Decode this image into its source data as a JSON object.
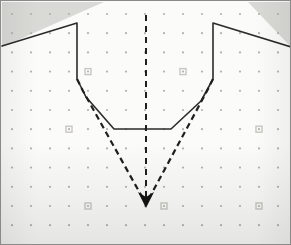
{
  "figure": {
    "title": "Cross-section profile over dot grid",
    "background_color": "#fbfbfa",
    "frame_color": "#8a8a88",
    "shaded_region_color": "#d9d9d6"
  },
  "geometry": {
    "frame": {
      "x": 0,
      "y": 0,
      "width": 291,
      "height": 245
    },
    "plot_area": {
      "x": 1,
      "y": 1,
      "width": 289,
      "height": 243
    },
    "centerline_x": 145,
    "apex": {
      "x": 145,
      "y": 203
    },
    "left_wall_x": 76,
    "right_wall_x": 212,
    "wall_top_y": 22,
    "wall_bottom_y": 78,
    "flat_bottom_y": 128,
    "flat_bottom_x_start": 113,
    "flat_bottom_x_end": 170
  },
  "grid": {
    "label": "reference dot grid",
    "dot_color": "#b6b3ad",
    "dot_radius": 1.1,
    "spacing_x": 19,
    "spacing_y": 19.2,
    "origin_x": 11,
    "origin_y": 13,
    "columns": 16,
    "rows": 13,
    "marker_color": "#c9c6c0",
    "markers": [
      {
        "col": 4,
        "row": 3
      },
      {
        "col": 9,
        "row": 3
      },
      {
        "col": 3,
        "row": 6
      },
      {
        "col": 13,
        "row": 6
      },
      {
        "col": 4,
        "row": 10
      },
      {
        "col": 8,
        "row": 10
      },
      {
        "col": 13,
        "row": 10
      }
    ]
  },
  "shaded_regions": [
    {
      "name": "upper-left-shaded-bank",
      "points": "1,1 1,46 103,1"
    },
    {
      "name": "upper-right-shaded-bank",
      "points": "247,1 290,1 290,46"
    }
  ],
  "series": [
    {
      "name": "measured-profile",
      "label": "Measured profile (solid)",
      "style": "solid",
      "color": "#2b2b2b",
      "width": 1.6,
      "points": "1,45 76,22 76,78 85,96 113,128 170,128 200,100 212,78 212,22 290,46"
    },
    {
      "name": "theoretical-profile-left",
      "label": "Theoretical V-profile, left limb (dashed)",
      "style": "dashed",
      "color": "#1f1f1f",
      "width": 2.2,
      "dash": "6 4",
      "points": "76,78 82,90 145,203"
    },
    {
      "name": "theoretical-profile-right",
      "label": "Theoretical V-profile, right limb (dashed)",
      "style": "dashed",
      "color": "#1f1f1f",
      "width": 2.2,
      "dash": "6 4",
      "points": "212,78 206,90 145,203"
    },
    {
      "name": "centerline",
      "label": "Vertical centreline (dashed)",
      "style": "dashed",
      "color": "#1f1f1f",
      "width": 2.0,
      "dash": "6 5",
      "points": "145,14 145,203"
    }
  ],
  "arrow": {
    "name": "apex-arrowhead",
    "label": "Apex marker arrowhead",
    "color": "#141414",
    "points": "145,207 137,191 145,196 153,191"
  }
}
